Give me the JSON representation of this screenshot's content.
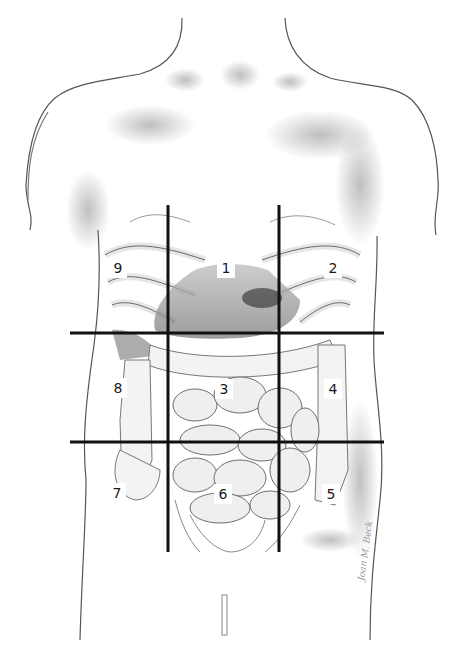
{
  "figure": {
    "grid": {
      "vertical_lines_x": [
        168,
        279
      ],
      "vertical_lines_y_range": [
        205,
        552
      ],
      "horizontal_lines_y": [
        333,
        442
      ],
      "horizontal_lines_x_range": [
        70,
        384
      ],
      "line_color": "#111111"
    },
    "regions": [
      {
        "number": "1",
        "x": 226,
        "y": 268
      },
      {
        "number": "2",
        "x": 333,
        "y": 268
      },
      {
        "number": "3",
        "x": 224,
        "y": 389
      },
      {
        "number": "4",
        "x": 333,
        "y": 389
      },
      {
        "number": "5",
        "x": 331,
        "y": 494
      },
      {
        "number": "6",
        "x": 223,
        "y": 494
      },
      {
        "number": "7",
        "x": 117,
        "y": 493
      },
      {
        "number": "8",
        "x": 118,
        "y": 388
      },
      {
        "number": "9",
        "x": 118,
        "y": 268
      }
    ],
    "signature": "Joan M. Beck"
  }
}
